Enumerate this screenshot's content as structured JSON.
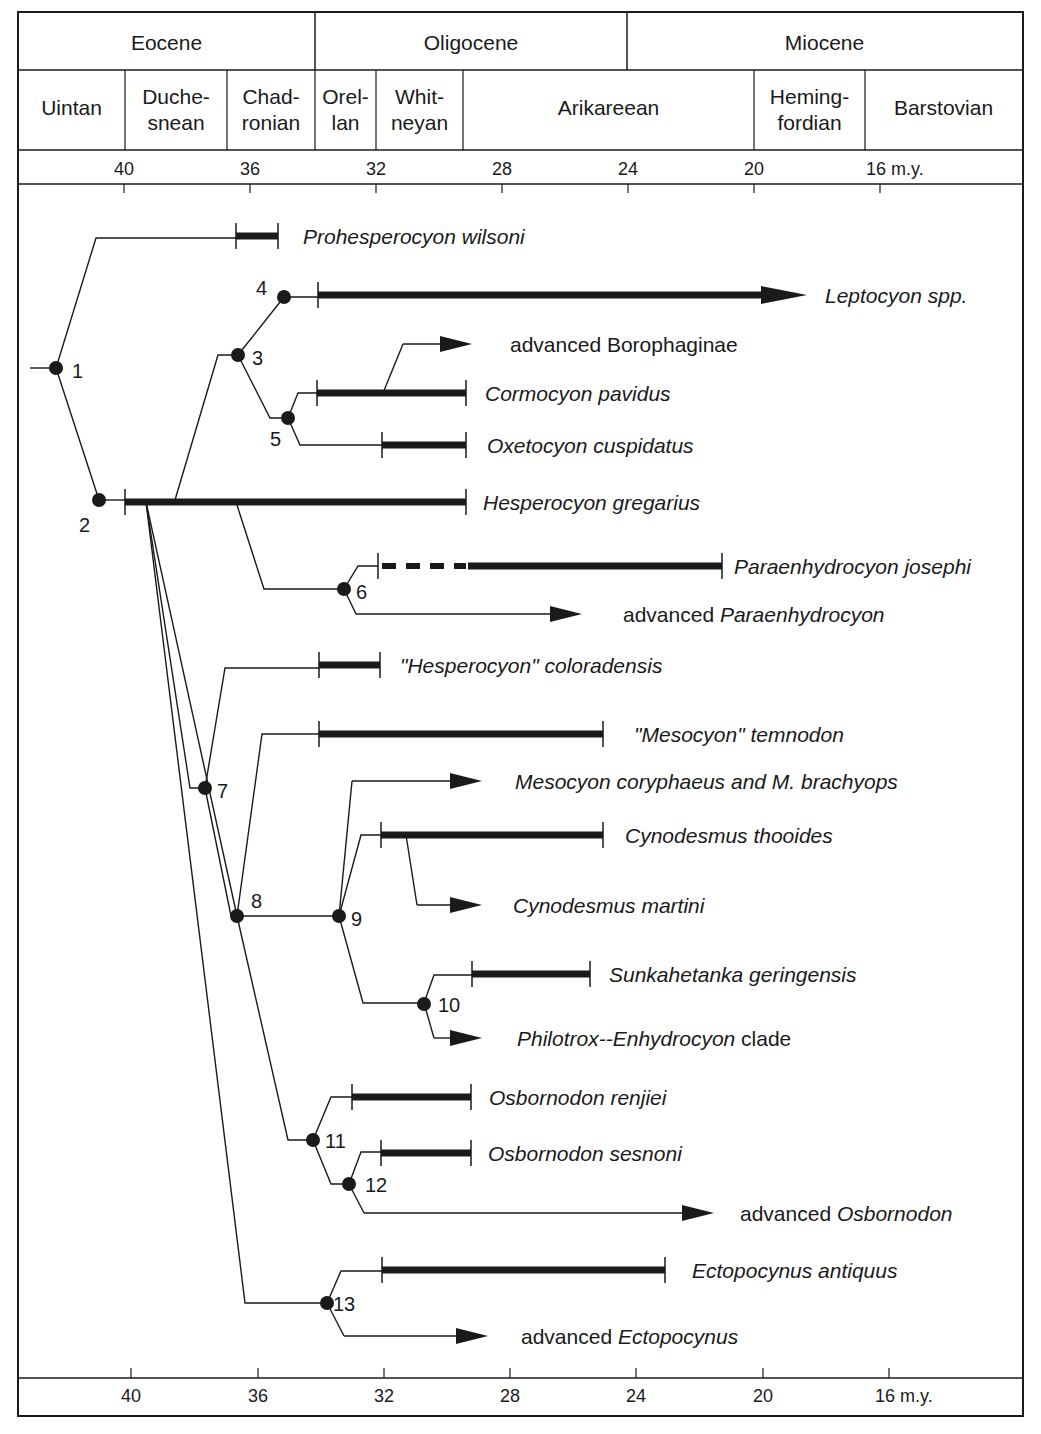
{
  "header": {
    "epochs": [
      {
        "label": "Eocene",
        "x0": 18,
        "x1": 315
      },
      {
        "label": "Oligocene",
        "x0": 315,
        "x1": 627
      },
      {
        "label": "Miocene",
        "x0": 627,
        "x1": 1022
      }
    ],
    "ages": [
      {
        "lines": [
          "Uintan"
        ],
        "x0": 18,
        "x1": 125
      },
      {
        "lines": [
          "Duche-",
          "snean"
        ],
        "x0": 125,
        "x1": 227
      },
      {
        "lines": [
          "Chad-",
          "ronian"
        ],
        "x0": 227,
        "x1": 315
      },
      {
        "lines": [
          "Orel-",
          "lan"
        ],
        "x0": 315,
        "x1": 376
      },
      {
        "lines": [
          "Whit-",
          "neyan"
        ],
        "x0": 376,
        "x1": 463
      },
      {
        "lines": [
          "Arikareean"
        ],
        "x0": 463,
        "x1": 754
      },
      {
        "lines": [
          "Heming-",
          "fordian"
        ],
        "x0": 754,
        "x1": 865
      },
      {
        "lines": [
          "Barstovian"
        ],
        "x0": 865,
        "x1": 1022
      }
    ]
  },
  "time_axis": {
    "unit_label": "m.y.",
    "ticks": [
      {
        "ma": 40,
        "label": "40"
      },
      {
        "ma": 36,
        "label": "36"
      },
      {
        "ma": 32,
        "label": "32"
      },
      {
        "ma": 28,
        "label": "28"
      },
      {
        "ma": 24,
        "label": "24"
      },
      {
        "ma": 20,
        "label": "20"
      },
      {
        "ma": 16,
        "label": "16 m.y."
      }
    ],
    "top_tick_x": {
      "40": 124,
      "36": 250,
      "32": 376,
      "28": 502,
      "24": 628,
      "20": 754,
      "16": 880
    },
    "bottom_tick_x": {
      "40": 131,
      "36": 258,
      "32": 384,
      "28": 510,
      "24": 636,
      "20": 763,
      "16": 889
    }
  },
  "nodes": [
    {
      "id": "1",
      "x": 56,
      "y": 368,
      "label_dx": 16,
      "label_dy": 10
    },
    {
      "id": "2",
      "x": 99,
      "y": 500,
      "label_dx": -20,
      "label_dy": 32
    },
    {
      "id": "3",
      "x": 238,
      "y": 355,
      "label_dx": 14,
      "label_dy": 10
    },
    {
      "id": "4",
      "x": 284,
      "y": 297,
      "label_dx": -28,
      "label_dy": -2
    },
    {
      "id": "5",
      "x": 288,
      "y": 418,
      "label_dx": -18,
      "label_dy": 28
    },
    {
      "id": "6",
      "x": 344,
      "y": 589,
      "label_dx": 12,
      "label_dy": 10
    },
    {
      "id": "7",
      "x": 205,
      "y": 788,
      "label_dx": 12,
      "label_dy": 10
    },
    {
      "id": "8",
      "x": 237,
      "y": 916,
      "label_dx": 14,
      "label_dy": -8
    },
    {
      "id": "9",
      "x": 339,
      "y": 916,
      "label_dx": 12,
      "label_dy": 10
    },
    {
      "id": "10",
      "x": 424,
      "y": 1004,
      "label_dx": 14,
      "label_dy": 8
    },
    {
      "id": "11",
      "x": 313,
      "y": 1140,
      "label_dx": 12,
      "label_dy": 8
    },
    {
      "id": "12",
      "x": 349,
      "y": 1184,
      "label_dx": 16,
      "label_dy": 8
    },
    {
      "id": "13",
      "x": 327,
      "y": 1303,
      "label_dx": 6,
      "label_dy": 8
    }
  ],
  "taxa": [
    {
      "name": "Prohesperocyon wilsoni",
      "parts": [
        {
          "t": "Prohesperocyon wilsoni",
          "i": true
        }
      ],
      "y": 236,
      "bar": [
        236,
        278
      ],
      "label_x": 303
    },
    {
      "name": "Leptocyon spp.",
      "parts": [
        {
          "t": "Leptocyon spp.",
          "i": true
        }
      ],
      "y": 295,
      "bar": [
        318,
        785
      ],
      "arrow": true,
      "label_x": 825
    },
    {
      "name": "advanced Borophaginae",
      "parts": [
        {
          "t": "advanced Borophaginae",
          "i": false
        }
      ],
      "y": 344,
      "line": [
        403,
        470
      ],
      "arrow": true,
      "label_x": 510
    },
    {
      "name": "Cormocyon pavidus",
      "parts": [
        {
          "t": "Cormocyon pavidus",
          "i": true
        }
      ],
      "y": 393,
      "bar": [
        317,
        466
      ],
      "label_x": 485
    },
    {
      "name": "Oxetocyon cuspidatus",
      "parts": [
        {
          "t": "Oxetocyon cuspidatus",
          "i": true
        }
      ],
      "y": 445,
      "bar": [
        382,
        466
      ],
      "label_x": 487
    },
    {
      "name": "Hesperocyon gregarius",
      "parts": [
        {
          "t": "Hesperocyon gregarius",
          "i": true
        }
      ],
      "y": 502,
      "bar": [
        125,
        466
      ],
      "label_x": 483
    },
    {
      "name": "Paraenhydrocyon josephi",
      "parts": [
        {
          "t": "Paraenhydrocyon josephi",
          "i": true
        }
      ],
      "y": 566,
      "bar": [
        468,
        722
      ],
      "dashed": [
        378,
        466
      ],
      "label_x": 734
    },
    {
      "name": "advanced Paraenhydrocyon",
      "parts": [
        {
          "t": "advanced ",
          "i": false
        },
        {
          "t": "Paraenhydrocyon",
          "i": true
        }
      ],
      "y": 614,
      "line": [
        356,
        580
      ],
      "arrow": true,
      "label_x": 623
    },
    {
      "name": "\"Hesperocyon\" coloradensis",
      "parts": [
        {
          "t": "\"Hesperocyon\" coloradensis",
          "i": true
        }
      ],
      "y": 665,
      "bar": [
        319,
        380
      ],
      "label_x": 400
    },
    {
      "name": "\"Mesocyon\" temnodon",
      "parts": [
        {
          "t": "\"Mesocyon\" temnodon",
          "i": true
        }
      ],
      "y": 734,
      "bar": [
        319,
        603
      ],
      "label_x": 634
    },
    {
      "name": "Mesocyon coryphaeus and M. brachyops",
      "parts": [
        {
          "t": "Mesocyon coryphaeus and M. brachyops",
          "i": true
        }
      ],
      "y": 781,
      "line": [
        352,
        480
      ],
      "arrow": true,
      "label_x": 515
    },
    {
      "name": "Cynodesmus thooides",
      "parts": [
        {
          "t": "Cynodesmus thooides",
          "i": true
        }
      ],
      "y": 835,
      "bar": [
        381,
        603
      ],
      "label_x": 625
    },
    {
      "name": "Cynodesmus martini",
      "parts": [
        {
          "t": "Cynodesmus martini",
          "i": true
        }
      ],
      "y": 905,
      "line": [
        417,
        480
      ],
      "arrow": true,
      "label_x": 513
    },
    {
      "name": "Sunkahetanka geringensis",
      "parts": [
        {
          "t": "Sunkahetanka geringensis",
          "i": true
        }
      ],
      "y": 974,
      "bar": [
        472,
        590
      ],
      "label_x": 609
    },
    {
      "name": "Philotrox--Enhydrocyon clade",
      "parts": [
        {
          "t": "Philotrox--Enhydrocyon",
          "i": true
        },
        {
          "t": "  clade",
          "i": false
        }
      ],
      "y": 1038,
      "line": [
        434,
        480
      ],
      "arrow": true,
      "label_x": 517
    },
    {
      "name": "Osbornodon renjiei",
      "parts": [
        {
          "t": "Osbornodon renjiei",
          "i": true
        }
      ],
      "y": 1097,
      "bar": [
        352,
        471
      ],
      "label_x": 489
    },
    {
      "name": "Osbornodon sesnoni",
      "parts": [
        {
          "t": "Osbornodon sesnoni",
          "i": true
        }
      ],
      "y": 1153,
      "bar": [
        381,
        471
      ],
      "label_x": 488
    },
    {
      "name": "advanced Osbornodon",
      "parts": [
        {
          "t": "advanced ",
          "i": false
        },
        {
          "t": "Osbornodon",
          "i": true
        }
      ],
      "y": 1213,
      "line": [
        364,
        712
      ],
      "arrow": true,
      "label_x": 740
    },
    {
      "name": "Ectopocynus antiquus",
      "parts": [
        {
          "t": "Ectopocynus antiquus",
          "i": true
        }
      ],
      "y": 1270,
      "bar": [
        382,
        665
      ],
      "label_x": 692
    },
    {
      "name": "advanced Ectopocynus",
      "parts": [
        {
          "t": "advanced ",
          "i": false
        },
        {
          "t": "Ectopocynus",
          "i": true
        }
      ],
      "y": 1336,
      "line": [
        344,
        486
      ],
      "arrow": true,
      "label_x": 521
    }
  ],
  "branches": [
    "M30,368 L56,368",
    "M56,368 L96,238 L236,238",
    "M56,368 L99,500",
    "M99,500 L125,500",
    "M175,500 L218,355 L238,355",
    "M238,355 L284,297 L318,297",
    "M238,355 L270,418 L288,418",
    "M288,418 L298,393 L317,393",
    "M288,418 L300,445 L382,445",
    "M383,393 L403,344",
    "M236,502 L264,589 L344,589",
    "M344,589 L358,566 L378,566",
    "M344,589 L356,614",
    "M146,502 L190,788 L205,788",
    "M205,788 L225,668 L319,668",
    "M146,502 L237,916",
    "M205,788 L231,916 L237,916",
    "M237,916 L262,734 L319,734",
    "M237,916 L339,916",
    "M339,916 L352,781",
    "M339,916 L361,835 L381,835",
    "M406,835 L417,905",
    "M339,916 L363,1003 L424,1003",
    "M424,1003 L434,975 L472,975",
    "M424,1003 L434,1038",
    "M237,916 L288,1140 L313,1140",
    "M313,1140 L331,1097 L352,1097",
    "M313,1140 L331,1184 L349,1184",
    "M349,1184 L361,1152 L381,1152",
    "M349,1184 L364,1213",
    "M146,502 L245,1303 L327,1303",
    "M327,1303 L341,1271 L382,1271",
    "M327,1303 L344,1336"
  ],
  "colors": {
    "ink": "#1a1a1a",
    "background": "#ffffff"
  }
}
